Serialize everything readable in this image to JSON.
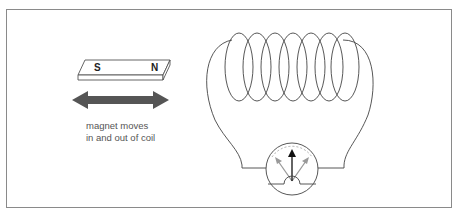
{
  "diagram": {
    "magnet": {
      "south_label": "S",
      "north_label": "N"
    },
    "arrow": {
      "meaning": "double-headed motion arrow",
      "color": "#555555"
    },
    "caption": {
      "line1": "magnet moves",
      "line2": "in and out of coil"
    },
    "coil": {
      "turns": 7,
      "stroke": "#444444"
    },
    "meter": {
      "type": "galvanometer",
      "needle_color": "#111111",
      "ghost_needle_color": "#999999"
    },
    "colors": {
      "frame": "#8a8a8a",
      "line": "#444444",
      "arrow_fill": "#555555",
      "text": "#555555"
    }
  }
}
